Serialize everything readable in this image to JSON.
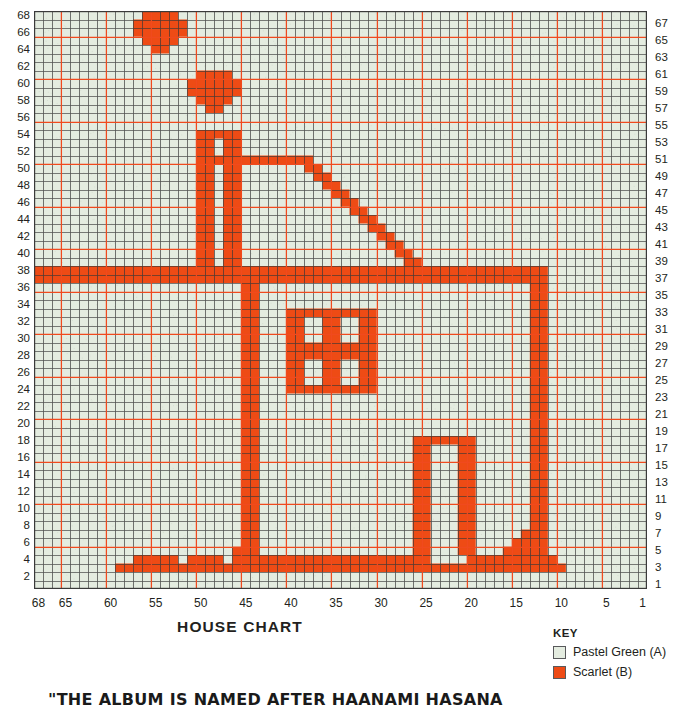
{
  "chart_data": {
    "type": "heatmap",
    "title": "HOUSE CHART",
    "xlabel": "",
    "ylabel": "",
    "grid": true,
    "cols": 68,
    "rows": 68,
    "col_order": "right-to-left",
    "row_order": "bottom-to-top",
    "heavy_line_every": 5,
    "colors": {
      "background": "#e4ece0",
      "fill": "#ee4b15",
      "minor_grid": "#4d4d4d",
      "major_grid": "#f04a1e",
      "text": "#231f20"
    },
    "x_ticks": [
      68,
      65,
      60,
      55,
      50,
      45,
      40,
      35,
      30,
      25,
      20,
      15,
      10,
      5,
      1
    ],
    "y_ticks_left": [
      68,
      66,
      64,
      62,
      60,
      58,
      56,
      54,
      52,
      50,
      48,
      46,
      44,
      42,
      40,
      38,
      36,
      34,
      32,
      30,
      28,
      26,
      24,
      22,
      20,
      18,
      16,
      14,
      12,
      10,
      8,
      6,
      4,
      2
    ],
    "y_ticks_right": [
      67,
      65,
      63,
      61,
      59,
      57,
      55,
      53,
      51,
      49,
      47,
      45,
      43,
      41,
      39,
      37,
      35,
      33,
      31,
      29,
      27,
      25,
      23,
      21,
      19,
      17,
      15,
      13,
      11,
      9,
      7,
      5,
      3,
      1
    ],
    "legend_position": "bottom-right",
    "series": [
      {
        "name": "Pastel Green (A)",
        "color": "#e4ece0",
        "symbol": "open-square"
      },
      {
        "name": "Scarlet (B)",
        "color": "#ee4b15",
        "symbol": "filled-square"
      }
    ],
    "filled_runs": [
      {
        "row": 68,
        "runs": [
          [
            53,
            56
          ]
        ]
      },
      {
        "row": 67,
        "runs": [
          [
            52,
            57
          ]
        ]
      },
      {
        "row": 66,
        "runs": [
          [
            52,
            57
          ]
        ]
      },
      {
        "row": 65,
        "runs": [
          [
            53,
            56
          ]
        ]
      },
      {
        "row": 64,
        "runs": [
          [
            54,
            55
          ]
        ]
      },
      {
        "row": 61,
        "runs": [
          [
            47,
            50
          ]
        ]
      },
      {
        "row": 60,
        "runs": [
          [
            46,
            51
          ]
        ]
      },
      {
        "row": 59,
        "runs": [
          [
            46,
            51
          ]
        ]
      },
      {
        "row": 58,
        "runs": [
          [
            47,
            50
          ]
        ]
      },
      {
        "row": 57,
        "runs": [
          [
            48,
            49
          ]
        ]
      },
      {
        "row": 54,
        "runs": [
          [
            46,
            50
          ]
        ]
      },
      {
        "row": 53,
        "runs": [
          [
            46,
            47
          ],
          [
            49,
            50
          ]
        ]
      },
      {
        "row": 52,
        "runs": [
          [
            46,
            47
          ],
          [
            49,
            50
          ]
        ]
      },
      {
        "row": 51,
        "runs": [
          [
            38,
            50
          ]
        ]
      },
      {
        "row": 50,
        "runs": [
          [
            37,
            38
          ],
          [
            46,
            47
          ],
          [
            49,
            50
          ]
        ]
      },
      {
        "row": 49,
        "runs": [
          [
            36,
            37
          ],
          [
            46,
            47
          ],
          [
            49,
            50
          ]
        ]
      },
      {
        "row": 48,
        "runs": [
          [
            35,
            36
          ],
          [
            46,
            47
          ],
          [
            49,
            50
          ]
        ]
      },
      {
        "row": 47,
        "runs": [
          [
            34,
            35
          ],
          [
            46,
            47
          ],
          [
            49,
            50
          ]
        ]
      },
      {
        "row": 46,
        "runs": [
          [
            33,
            34
          ],
          [
            46,
            47
          ],
          [
            49,
            50
          ]
        ]
      },
      {
        "row": 45,
        "runs": [
          [
            32,
            33
          ],
          [
            46,
            47
          ],
          [
            49,
            50
          ]
        ]
      },
      {
        "row": 44,
        "runs": [
          [
            31,
            32
          ],
          [
            46,
            47
          ],
          [
            49,
            50
          ]
        ]
      },
      {
        "row": 43,
        "runs": [
          [
            30,
            31
          ],
          [
            46,
            47
          ],
          [
            49,
            50
          ]
        ]
      },
      {
        "row": 42,
        "runs": [
          [
            29,
            30
          ],
          [
            46,
            47
          ],
          [
            49,
            50
          ]
        ]
      },
      {
        "row": 41,
        "runs": [
          [
            28,
            29
          ],
          [
            46,
            47
          ],
          [
            49,
            50
          ]
        ]
      },
      {
        "row": 40,
        "runs": [
          [
            27,
            28
          ],
          [
            46,
            47
          ],
          [
            49,
            50
          ]
        ]
      },
      {
        "row": 39,
        "runs": [
          [
            26,
            27
          ],
          [
            46,
            47
          ],
          [
            49,
            50
          ]
        ]
      },
      {
        "row": 38,
        "runs": [
          [
            12,
            68
          ]
        ]
      },
      {
        "row": 37,
        "runs": [
          [
            12,
            68
          ]
        ]
      },
      {
        "row": 36,
        "runs": [
          [
            12,
            13
          ],
          [
            44,
            45
          ]
        ]
      },
      {
        "row": 35,
        "runs": [
          [
            12,
            13
          ],
          [
            44,
            45
          ]
        ]
      },
      {
        "row": 34,
        "runs": [
          [
            12,
            13
          ],
          [
            44,
            45
          ]
        ]
      },
      {
        "row": 33,
        "runs": [
          [
            12,
            13
          ],
          [
            31,
            40
          ],
          [
            44,
            45
          ]
        ]
      },
      {
        "row": 32,
        "runs": [
          [
            12,
            13
          ],
          [
            31,
            32
          ],
          [
            35,
            36
          ],
          [
            39,
            40
          ],
          [
            44,
            45
          ]
        ]
      },
      {
        "row": 31,
        "runs": [
          [
            12,
            13
          ],
          [
            31,
            32
          ],
          [
            35,
            36
          ],
          [
            39,
            40
          ],
          [
            44,
            45
          ]
        ]
      },
      {
        "row": 30,
        "runs": [
          [
            12,
            13
          ],
          [
            31,
            32
          ],
          [
            35,
            36
          ],
          [
            39,
            40
          ],
          [
            44,
            45
          ]
        ]
      },
      {
        "row": 29,
        "runs": [
          [
            12,
            13
          ],
          [
            31,
            40
          ],
          [
            44,
            45
          ]
        ]
      },
      {
        "row": 28,
        "runs": [
          [
            12,
            13
          ],
          [
            31,
            40
          ],
          [
            44,
            45
          ]
        ]
      },
      {
        "row": 27,
        "runs": [
          [
            12,
            13
          ],
          [
            31,
            32
          ],
          [
            35,
            36
          ],
          [
            39,
            40
          ],
          [
            44,
            45
          ]
        ]
      },
      {
        "row": 26,
        "runs": [
          [
            12,
            13
          ],
          [
            31,
            32
          ],
          [
            35,
            36
          ],
          [
            39,
            40
          ],
          [
            44,
            45
          ]
        ]
      },
      {
        "row": 25,
        "runs": [
          [
            12,
            13
          ],
          [
            31,
            32
          ],
          [
            35,
            36
          ],
          [
            39,
            40
          ],
          [
            44,
            45
          ]
        ]
      },
      {
        "row": 24,
        "runs": [
          [
            12,
            13
          ],
          [
            31,
            40
          ],
          [
            44,
            45
          ]
        ]
      },
      {
        "row": 23,
        "runs": [
          [
            12,
            13
          ],
          [
            44,
            45
          ]
        ]
      },
      {
        "row": 22,
        "runs": [
          [
            12,
            13
          ],
          [
            44,
            45
          ]
        ]
      },
      {
        "row": 21,
        "runs": [
          [
            12,
            13
          ],
          [
            44,
            45
          ]
        ]
      },
      {
        "row": 20,
        "runs": [
          [
            12,
            13
          ],
          [
            44,
            45
          ]
        ]
      },
      {
        "row": 19,
        "runs": [
          [
            12,
            13
          ],
          [
            44,
            45
          ]
        ]
      },
      {
        "row": 18,
        "runs": [
          [
            12,
            13
          ],
          [
            20,
            26
          ],
          [
            44,
            45
          ]
        ]
      },
      {
        "row": 17,
        "runs": [
          [
            12,
            13
          ],
          [
            20,
            21
          ],
          [
            25,
            26
          ],
          [
            44,
            45
          ]
        ]
      },
      {
        "row": 16,
        "runs": [
          [
            12,
            13
          ],
          [
            20,
            21
          ],
          [
            25,
            26
          ],
          [
            44,
            45
          ]
        ]
      },
      {
        "row": 15,
        "runs": [
          [
            12,
            13
          ],
          [
            20,
            21
          ],
          [
            25,
            26
          ],
          [
            44,
            45
          ]
        ]
      },
      {
        "row": 14,
        "runs": [
          [
            12,
            13
          ],
          [
            20,
            21
          ],
          [
            25,
            26
          ],
          [
            44,
            45
          ]
        ]
      },
      {
        "row": 13,
        "runs": [
          [
            12,
            13
          ],
          [
            20,
            21
          ],
          [
            25,
            26
          ],
          [
            44,
            45
          ]
        ]
      },
      {
        "row": 12,
        "runs": [
          [
            12,
            13
          ],
          [
            20,
            21
          ],
          [
            25,
            26
          ],
          [
            44,
            45
          ]
        ]
      },
      {
        "row": 11,
        "runs": [
          [
            12,
            13
          ],
          [
            20,
            21
          ],
          [
            25,
            26
          ],
          [
            44,
            45
          ]
        ]
      },
      {
        "row": 10,
        "runs": [
          [
            12,
            13
          ],
          [
            20,
            21
          ],
          [
            25,
            26
          ],
          [
            44,
            45
          ]
        ]
      },
      {
        "row": 9,
        "runs": [
          [
            12,
            13
          ],
          [
            20,
            21
          ],
          [
            25,
            26
          ],
          [
            44,
            45
          ]
        ]
      },
      {
        "row": 8,
        "runs": [
          [
            12,
            13
          ],
          [
            20,
            21
          ],
          [
            25,
            26
          ],
          [
            44,
            45
          ]
        ]
      },
      {
        "row": 7,
        "runs": [
          [
            12,
            14
          ],
          [
            20,
            21
          ],
          [
            25,
            26
          ],
          [
            44,
            45
          ]
        ]
      },
      {
        "row": 6,
        "runs": [
          [
            12,
            15
          ],
          [
            20,
            21
          ],
          [
            25,
            26
          ],
          [
            44,
            45
          ]
        ]
      },
      {
        "row": 5,
        "runs": [
          [
            12,
            16
          ],
          [
            20,
            21
          ],
          [
            25,
            26
          ],
          [
            44,
            46
          ]
        ]
      },
      {
        "row": 4,
        "runs": [
          [
            11,
            20
          ],
          [
            25,
            46
          ],
          [
            48,
            51
          ],
          [
            53,
            57
          ]
        ]
      },
      {
        "row": 3,
        "runs": [
          [
            10,
            59
          ]
        ]
      }
    ]
  },
  "chart": {
    "title": "HOUSE CHART"
  },
  "key": {
    "heading": "KEY",
    "items": [
      {
        "label": "Pastel Green (A)",
        "color": "#e4ece0"
      },
      {
        "label": "Scarlet (B)",
        "color": "#ee4b15"
      }
    ]
  },
  "quote": {
    "text": "\"THE ALBUM IS NAMED AFTER HAANAMI HASANA"
  }
}
